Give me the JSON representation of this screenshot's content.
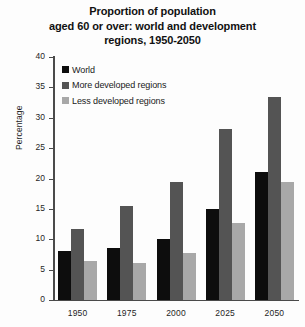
{
  "chart_data": {
    "type": "bar",
    "title": "Proportion of population aged 60 or over: world and development regions, 1950-2050",
    "title_lines": [
      "Proportion of population",
      "aged 60 or over: world and development",
      "regions, 1950-2050"
    ],
    "xlabel": "",
    "ylabel": "Percentage",
    "ylim": [
      0,
      40
    ],
    "ytick_values": [
      0,
      5,
      10,
      15,
      20,
      25,
      30,
      35,
      40
    ],
    "ytick_labels": [
      "0",
      "5",
      "10",
      "15",
      "20",
      "25",
      "30",
      "35",
      "40"
    ],
    "grid": false,
    "legend_position": "top-left-inside",
    "categories": [
      "1950",
      "1975",
      "2000",
      "2025",
      "2050"
    ],
    "series": [
      {
        "name": "World",
        "color": "#0d0d0d",
        "values": [
          8.1,
          8.6,
          10.0,
          15.0,
          21.1
        ]
      },
      {
        "name": "More developed regions",
        "color": "#545454",
        "values": [
          11.7,
          15.4,
          19.5,
          28.2,
          33.5
        ]
      },
      {
        "name": "Less developed regions",
        "color": "#a8a8a8",
        "values": [
          6.4,
          6.1,
          7.7,
          12.6,
          19.4
        ]
      }
    ]
  }
}
